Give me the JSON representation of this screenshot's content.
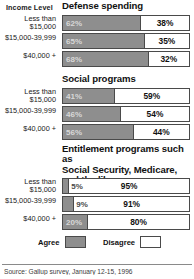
{
  "header": {
    "income_level_label": "Income Level"
  },
  "legend": {
    "agree_label": "Agree",
    "disagree_label": "Disagree",
    "agree_color": "#8e8e8e",
    "disagree_color": "#ffffff"
  },
  "source": {
    "text": "Source: Gallup survey, January 12-15, 1996"
  },
  "chart_data": {
    "type": "bar",
    "title": "",
    "xlabel": "",
    "ylabel": "Income Level",
    "xlim": [
      0,
      100
    ],
    "grid": false,
    "legend_position": "bottom",
    "orientation": "horizontal",
    "stacked": true,
    "series": [
      {
        "name": "Agree",
        "color": "#8e8e8e"
      },
      {
        "name": "Disagree",
        "color": "#ffffff"
      }
    ],
    "categories": [
      "Less than $15,000",
      "$15,000-39,999",
      "$40,000 +"
    ],
    "panels": [
      {
        "title": "Defense spending",
        "rows": [
          {
            "category_line1": "Less than",
            "category_line2": "$15,000",
            "agree": 62,
            "disagree": 38,
            "agree_label": "62%",
            "disagree_label": "38%"
          },
          {
            "category_line1": "$15,000-39,999",
            "category_line2": "",
            "agree": 65,
            "disagree": 35,
            "agree_label": "65%",
            "disagree_label": "35%"
          },
          {
            "category_line1": "$40,000 +",
            "category_line2": "",
            "agree": 68,
            "disagree": 32,
            "agree_label": "68%",
            "disagree_label": "32%"
          }
        ]
      },
      {
        "title": "Social programs",
        "rows": [
          {
            "category_line1": "Less than",
            "category_line2": "$15,000",
            "agree": 41,
            "disagree": 59,
            "agree_label": "41%",
            "disagree_label": "59%"
          },
          {
            "category_line1": "$15,000-39,999",
            "category_line2": "",
            "agree": 46,
            "disagree": 54,
            "agree_label": "46%",
            "disagree_label": "54%"
          },
          {
            "category_line1": "$40,000 +",
            "category_line2": "",
            "agree": 56,
            "disagree": 44,
            "agree_label": "56%",
            "disagree_label": "44%"
          }
        ]
      },
      {
        "title": "Entitlement programs such as Social Security,  Medicare, and the like",
        "title_line1": "Entitlement programs such as",
        "title_line2": "Social Security,  Medicare,",
        "title_line3": "and the like",
        "rows": [
          {
            "category_line1": "Less than",
            "category_line2": "$15,000",
            "agree": 5,
            "disagree": 95,
            "agree_label": "5%",
            "disagree_label": "95%"
          },
          {
            "category_line1": "$15,000-39,999",
            "category_line2": "",
            "agree": 9,
            "disagree": 91,
            "agree_label": "9%",
            "disagree_label": "91%"
          },
          {
            "category_line1": "$40,000 +",
            "category_line2": "",
            "agree": 20,
            "disagree": 80,
            "agree_label": "20%",
            "disagree_label": "80%"
          }
        ]
      }
    ]
  }
}
